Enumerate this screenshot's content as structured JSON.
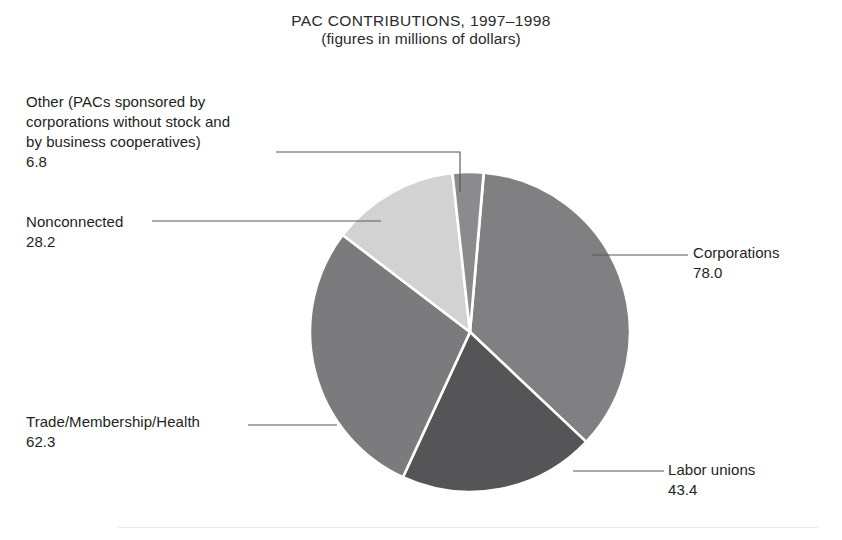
{
  "title": {
    "line1": "PAC CONTRIBUTIONS, 1997–1998",
    "line2": "(figures in millions of dollars)"
  },
  "chart_data": {
    "type": "pie",
    "title": "PAC CONTRIBUTIONS, 1997–1998",
    "subtitle": "(figures in millions of dollars)",
    "unit": "millions of dollars",
    "total": 218.7,
    "legend_position": "callout-labels",
    "grid": false,
    "categories": [
      "Corporations",
      "Labor unions",
      "Trade/Membership/Health",
      "Nonconnected",
      "Other (PACs sponsored by corporations without stock and by business cooperatives)"
    ],
    "values": [
      78.0,
      43.4,
      62.3,
      28.2,
      6.8
    ],
    "slices": [
      {
        "id": "corporations",
        "label": "Corporations",
        "value": 78.0,
        "value_text": "78.0",
        "color": "#808082",
        "start_angle": 5.0,
        "sweep_angle": 128.4,
        "label_side": "right"
      },
      {
        "id": "labor-unions",
        "label": "Labor unions",
        "value": 43.4,
        "value_text": "43.4",
        "color": "#555557",
        "start_angle": 133.4,
        "sweep_angle": 71.4,
        "label_side": "right"
      },
      {
        "id": "trade-membership-health",
        "label": "Trade/Membership/Health",
        "value": 62.3,
        "value_text": "62.3",
        "color": "#7b7b7d",
        "start_angle": 204.8,
        "sweep_angle": 102.5,
        "label_side": "left"
      },
      {
        "id": "nonconnected",
        "label": "Nonconnected",
        "value": 28.2,
        "value_text": "28.2",
        "color": "#d2d2d3",
        "start_angle": 307.3,
        "sweep_angle": 46.4,
        "label_side": "left"
      },
      {
        "id": "other",
        "label": "Other (PACs sponsored by\ncorporations without stock and\nby business cooperatives)",
        "label_flat": "Other (PACs sponsored by corporations without stock and by business cooperatives)",
        "value": 6.8,
        "value_text": "6.8",
        "color": "#8b8b8d",
        "start_angle": 353.7,
        "sweep_angle": 11.2,
        "label_side": "top-left"
      }
    ],
    "geometry": {
      "center_x": 470,
      "center_y": 332,
      "radius": 160
    }
  },
  "callouts": {
    "other": {
      "label": "Other (PACs sponsored by\ncorporations without stock and\nby business cooperatives)",
      "value": "6.8"
    },
    "nonconnected": {
      "label": "Nonconnected",
      "value": "28.2"
    },
    "trade": {
      "label": "Trade/Membership/Health",
      "value": "62.3"
    },
    "corporations": {
      "label": "Corporations",
      "value": "78.0"
    },
    "labor": {
      "label": "Labor unions",
      "value": "43.4"
    }
  }
}
